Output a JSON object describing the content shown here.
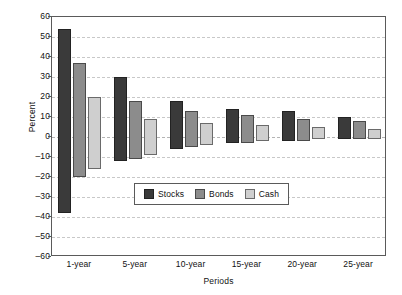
{
  "chart_data": {
    "type": "bar",
    "subtype": "floating-range-bar",
    "title": "",
    "xlabel": "Periods",
    "ylabel": "Percent",
    "categories": [
      "1-year",
      "5-year",
      "10-year",
      "15-year",
      "20-year",
      "25-year"
    ],
    "ylim": [
      -60,
      60
    ],
    "yticks": [
      60,
      50,
      40,
      30,
      20,
      10,
      0,
      -10,
      -20,
      -30,
      -40,
      -50,
      -60
    ],
    "ytick_labels": [
      "60",
      "50",
      "40",
      "30",
      "20",
      "10",
      "0",
      "–10",
      "–20",
      "–30",
      "–40",
      "–50",
      "–60"
    ],
    "grid": true,
    "grid_style": "dashed-horizontal",
    "legend_position": "inside-lower-center",
    "series": [
      {
        "name": "Stocks",
        "color": "#3a3a3a",
        "high": [
          54,
          30,
          18,
          14,
          13,
          10
        ],
        "low": [
          -38,
          -12,
          -6,
          -3,
          -2,
          -1
        ]
      },
      {
        "name": "Bonds",
        "color": "#8c8c8c",
        "high": [
          37,
          18,
          13,
          11,
          9,
          8
        ],
        "low": [
          -20,
          -11,
          -5,
          -3,
          -2,
          -1
        ]
      },
      {
        "name": "Cash",
        "color": "#cfcfcf",
        "high": [
          20,
          9,
          7,
          6,
          5,
          4
        ],
        "low": [
          -16,
          -9,
          -4,
          -2,
          -1,
          -1
        ]
      }
    ]
  }
}
